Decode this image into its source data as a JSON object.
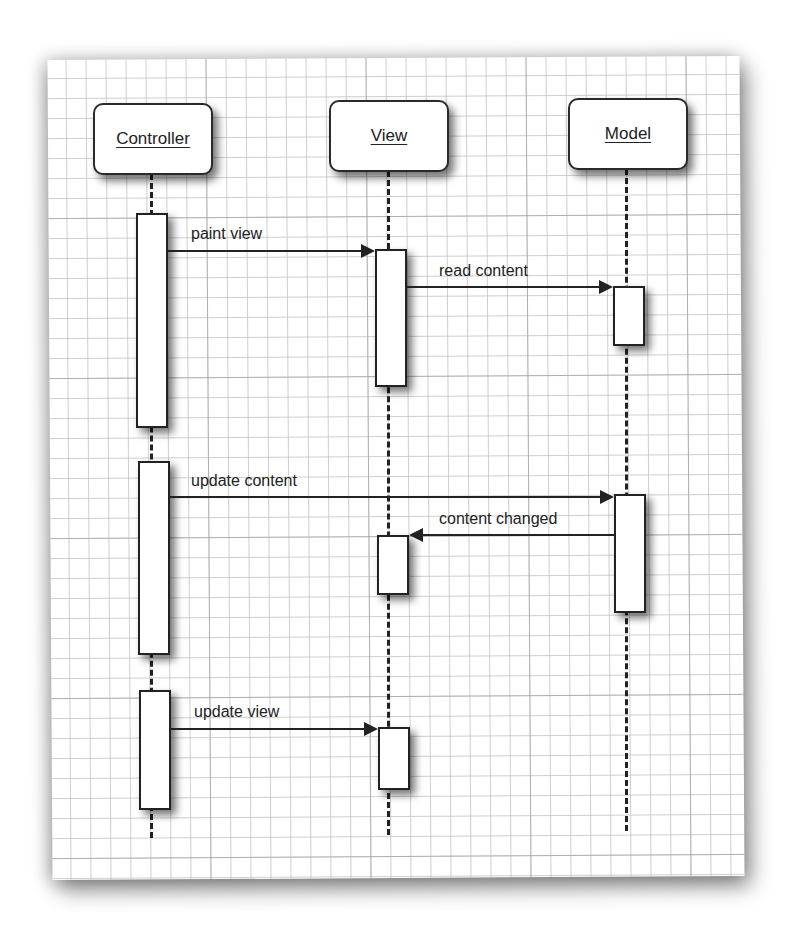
{
  "diagram": {
    "type": "sequence-diagram",
    "actors": [
      {
        "id": "controller",
        "label": "Controller"
      },
      {
        "id": "view",
        "label": "View"
      },
      {
        "id": "model",
        "label": "Model"
      }
    ],
    "messages": [
      {
        "from": "Controller",
        "to": "View",
        "label": "paint view"
      },
      {
        "from": "View",
        "to": "Model",
        "label": "read content"
      },
      {
        "from": "Controller",
        "to": "Model",
        "label": "update content"
      },
      {
        "from": "Model",
        "to": "View",
        "label": "content changed"
      },
      {
        "from": "Controller",
        "to": "View",
        "label": "update view"
      }
    ],
    "colors": {
      "line": "#222222",
      "grid": "#c0c0c0",
      "paper": "#ffffff"
    }
  }
}
